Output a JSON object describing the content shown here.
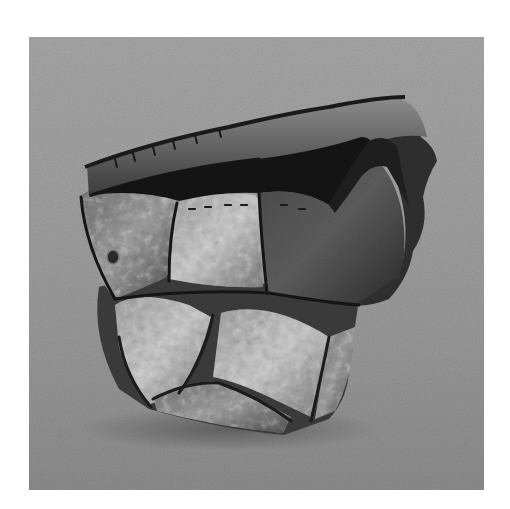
{
  "image": {
    "subject": "Sculptural ceramic vessel made of patchwork slab panels with stitched seams, photographed on a seamless gray backdrop",
    "style": "black-and-white photograph",
    "colors": {
      "page_background": "#ffffff",
      "backdrop_top": "#a4a4a4",
      "backdrop_bottom": "#8e8e8e",
      "vessel_dark": "#1e1e1e",
      "vessel_mid": "#5a5a5a",
      "vessel_light": "#b5b5b5",
      "interior": "#141414"
    },
    "frame": {
      "left": 29,
      "top": 37,
      "width": 455,
      "height": 453
    }
  }
}
